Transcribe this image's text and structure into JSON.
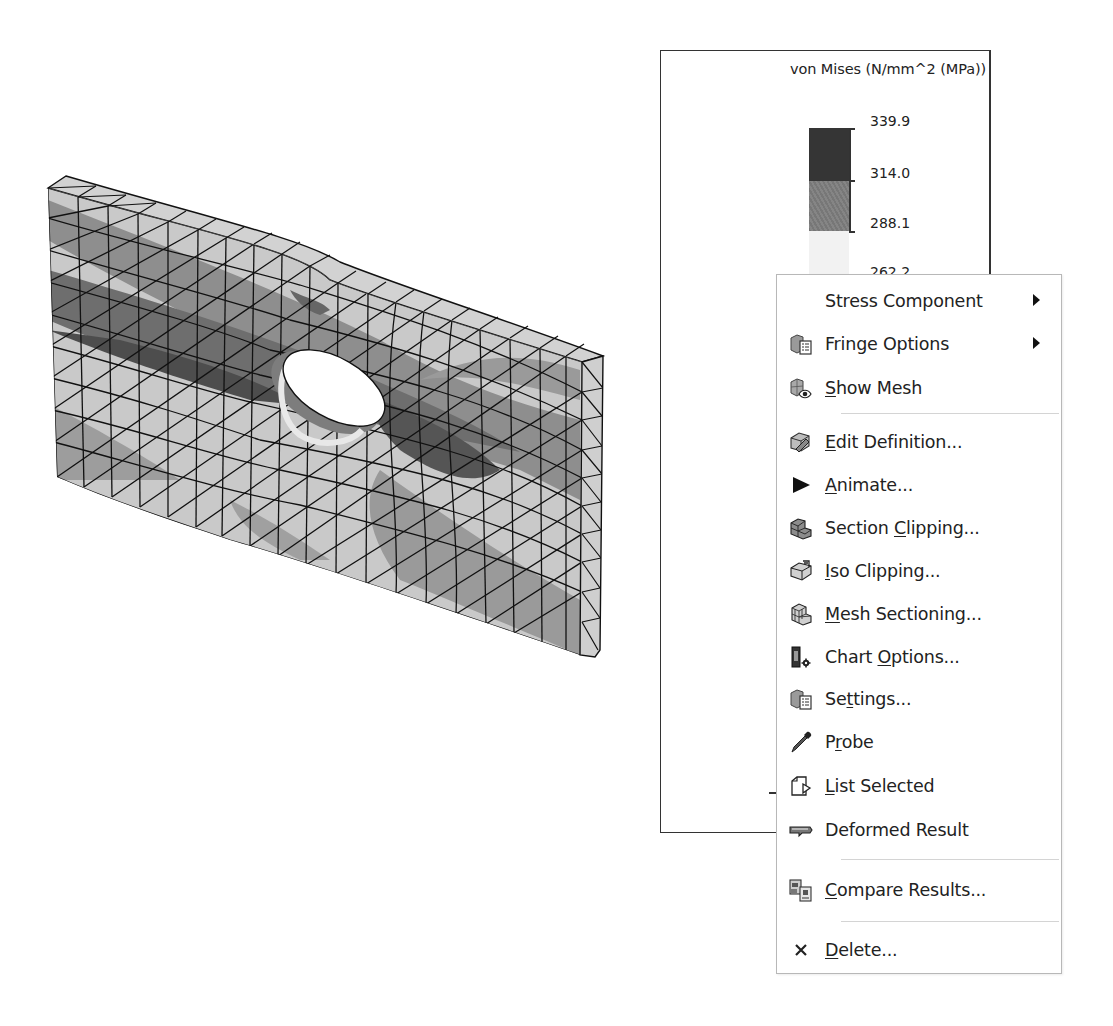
{
  "viewport": {
    "model": {
      "type": "fea-mesh-plate-with-hole",
      "description": "Deformed plate with elliptical hole, triangular mesh with stress contour bands",
      "colors": {
        "band_max": "#3a3a3a",
        "band_high": "#7a7a7a",
        "band_mid": "#9c9c9c",
        "band_low": "#c8c8c8",
        "band_min": "#dcdcdc",
        "mesh_line": "#111111"
      }
    }
  },
  "legend": {
    "title": "von Mises (N/mm^2 (MPa))",
    "ticks": [
      "339.9",
      "314.0",
      "288.1",
      "262.2"
    ],
    "band_colors": [
      "#353535",
      "#7c7c7c",
      "#f2f2f2"
    ]
  },
  "context_menu": {
    "items": [
      {
        "id": "stress-component",
        "icon": "none",
        "label": "Stress Component",
        "mnemonic": "",
        "submenu": true
      },
      {
        "id": "fringe-options",
        "icon": "fringe-options-icon",
        "label": "Fringe Options",
        "mnemonic": "",
        "submenu": true
      },
      {
        "id": "show-mesh",
        "icon": "show-mesh-icon",
        "label_pre": "",
        "mnemonic": "S",
        "label_post": "how Mesh",
        "label": "Show Mesh"
      },
      {
        "separator": true
      },
      {
        "id": "edit-definition",
        "icon": "edit-definition-icon",
        "label_pre": "",
        "mnemonic": "E",
        "label_post": "dit Definition...",
        "label": "Edit Definition..."
      },
      {
        "id": "animate",
        "icon": "play-icon",
        "label_pre": "",
        "mnemonic": "A",
        "label_post": "nimate...",
        "label": "Animate..."
      },
      {
        "id": "section-clipping",
        "icon": "section-clipping-icon",
        "label_pre": "Section ",
        "mnemonic": "C",
        "label_post": "lipping...",
        "label": "Section Clipping..."
      },
      {
        "id": "iso-clipping",
        "icon": "iso-clipping-icon",
        "label_pre": "",
        "mnemonic": "I",
        "label_post": "so Clipping...",
        "label": "Iso Clipping..."
      },
      {
        "id": "mesh-sectioning",
        "icon": "mesh-sectioning-icon",
        "label_pre": "",
        "mnemonic": "M",
        "label_post": "esh Sectioning...",
        "label": "Mesh Sectioning..."
      },
      {
        "id": "chart-options",
        "icon": "chart-options-icon",
        "label_pre": "Chart ",
        "mnemonic": "O",
        "label_post": "ptions...",
        "label": "Chart Options..."
      },
      {
        "id": "settings",
        "icon": "settings-icon",
        "label_pre": "Se",
        "mnemonic": "t",
        "label_post": "tings...",
        "label": "Settings..."
      },
      {
        "id": "probe",
        "icon": "probe-icon",
        "label_pre": "P",
        "mnemonic": "r",
        "label_post": "obe",
        "label": "Probe"
      },
      {
        "id": "list-selected",
        "icon": "list-selected-icon",
        "label_pre": "",
        "mnemonic": "L",
        "label_post": "ist Selected",
        "label": "List Selected"
      },
      {
        "id": "deformed-result",
        "icon": "deformed-result-icon",
        "label_pre": "Deformed Result",
        "mnemonic": "",
        "label_post": "",
        "label": "Deformed Result"
      },
      {
        "separator": true
      },
      {
        "id": "compare-results",
        "icon": "compare-results-icon",
        "label_pre": "",
        "mnemonic": "C",
        "label_post": "ompare Results...",
        "label": "Compare Results..."
      },
      {
        "separator": true
      },
      {
        "id": "delete",
        "icon": "delete-icon",
        "label_pre": "",
        "mnemonic": "D",
        "label_post": "elete...",
        "label": "Delete..."
      }
    ]
  }
}
